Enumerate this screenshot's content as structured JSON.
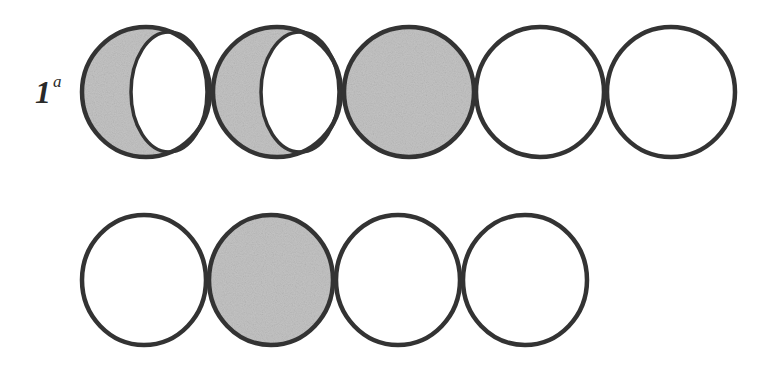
{
  "figure": {
    "label": {
      "number": "1",
      "superscript": "a"
    },
    "colors": {
      "stroke": "#333333",
      "fill_shaded": "#c4c4c4",
      "fill_empty": "#ffffff",
      "background": "#ffffff"
    },
    "rows": [
      {
        "name": "row-1",
        "shapes": [
          {
            "type": "crescent",
            "description": "circle shaded with unshaded inner ellipse on right (partially shaded)",
            "cx": 146,
            "cy": 92,
            "rx": 64,
            "ry": 65,
            "inner_cx": 169,
            "inner_rx": 38,
            "inner_ry": 60
          },
          {
            "type": "crescent",
            "description": "circle shaded with unshaded inner ellipse on right (partially shaded)",
            "cx": 277,
            "cy": 92,
            "rx": 64,
            "ry": 65,
            "inner_cx": 300,
            "inner_rx": 39,
            "inner_ry": 60
          },
          {
            "type": "shaded",
            "description": "fully shaded circle",
            "cx": 409,
            "cy": 92,
            "rx": 65,
            "ry": 65
          },
          {
            "type": "empty",
            "description": "empty circle",
            "cx": 540,
            "cy": 92,
            "rx": 64,
            "ry": 65
          },
          {
            "type": "empty",
            "description": "empty circle",
            "cx": 671,
            "cy": 92,
            "rx": 64,
            "ry": 65
          }
        ]
      },
      {
        "name": "row-2",
        "shapes": [
          {
            "type": "empty",
            "description": "empty circle",
            "cx": 144,
            "cy": 280,
            "rx": 62,
            "ry": 65
          },
          {
            "type": "shaded",
            "description": "fully shaded circle",
            "cx": 271,
            "cy": 280,
            "rx": 62,
            "ry": 65
          },
          {
            "type": "empty",
            "description": "empty circle",
            "cx": 398,
            "cy": 280,
            "rx": 62,
            "ry": 65
          },
          {
            "type": "empty",
            "description": "empty circle",
            "cx": 525,
            "cy": 280,
            "rx": 62,
            "ry": 65
          }
        ]
      }
    ]
  }
}
